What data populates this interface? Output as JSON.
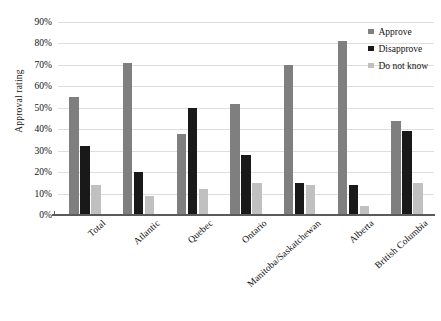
{
  "chart_data": {
    "type": "bar",
    "title": "",
    "subtitle": "",
    "xlabel": "",
    "ylabel": "Approval rating",
    "ylim": [
      0,
      90
    ],
    "ytick_step": 10,
    "ytick_labels": [
      "0%",
      "10%",
      "20%",
      "30%",
      "40%",
      "50%",
      "60%",
      "70%",
      "80%",
      "90%"
    ],
    "grid": true,
    "legend_position": "top-right",
    "categories": [
      "Total",
      "Atlantic",
      "Quebec",
      "Ontario",
      "Manitoba/Saskatchewan",
      "Alberta",
      "British Columbia"
    ],
    "series": [
      {
        "name": "Approve",
        "color": "#7f7f7f",
        "values": [
          55,
          71,
          38,
          52,
          70,
          81,
          44
        ]
      },
      {
        "name": "Disapprove",
        "color": "#191919",
        "values": [
          32,
          20,
          50,
          28,
          15,
          14,
          39
        ]
      },
      {
        "name": "Do not know",
        "color": "#c0c0c0",
        "values": [
          14,
          9,
          12,
          15,
          14,
          4,
          15
        ]
      }
    ]
  },
  "legend": {
    "items": [
      {
        "label": "Approve",
        "color": "#7f7f7f",
        "icon": "legend-square-icon"
      },
      {
        "label": "Disapprove",
        "color": "#191919",
        "icon": "legend-square-icon"
      },
      {
        "label": "Do not know",
        "color": "#c0c0c0",
        "icon": "legend-square-icon"
      }
    ]
  }
}
